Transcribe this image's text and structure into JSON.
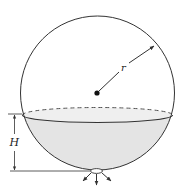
{
  "diagram": {
    "labels": {
      "radius": "r",
      "height": "H"
    },
    "colors": {
      "stroke": "#333333",
      "liquid_fill": "#e4e4e4",
      "liquid_surface": "#eeeeee",
      "background": "#ffffff"
    },
    "elements": [
      "sphere-outline",
      "center-point",
      "radius-arrow",
      "liquid-surface-ellipse",
      "liquid-body",
      "height-dimension",
      "outlet-orifice",
      "outflow-arrows"
    ]
  }
}
